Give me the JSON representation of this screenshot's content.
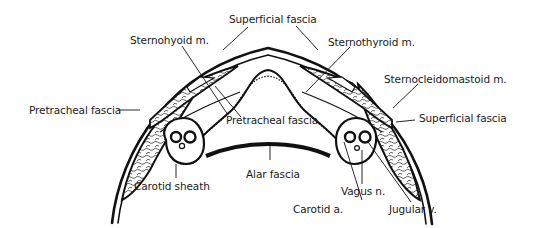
{
  "diagram": {
    "colors": {
      "ink": "#111111",
      "fill": "#ffffff"
    },
    "labels": {
      "superficial_fascia_top": "Superficial fascia",
      "sternohyoid": "Sternohyoid m.",
      "sternothyroid": "Sternothyroid m.",
      "sternocleidomastoid": "Sternocleidomastoid m.",
      "pretracheal_fascia_left": "Pretracheal fascia",
      "pretracheal_fascia_center": "Pretracheal fascia",
      "superficial_fascia_right": "Superficial fascia",
      "carotid_sheath": "Carotid sheath",
      "alar_fascia": "Alar fascia",
      "vagus_n": "Vagus n.",
      "carotid_a": "Carotid a.",
      "jugular_v": "Jugular v."
    }
  }
}
